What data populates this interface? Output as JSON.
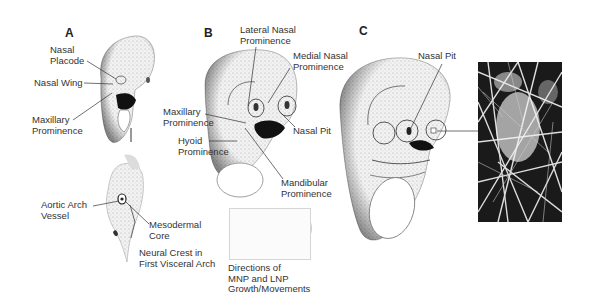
{
  "figure": {
    "panels": [
      {
        "id": "A",
        "label": "A"
      },
      {
        "id": "B",
        "label": "B"
      },
      {
        "id": "C",
        "label": "C"
      }
    ],
    "panel_a": {
      "labels": {
        "nasal_placode": [
          "Nasal",
          "Placode"
        ],
        "nasal_wing": "Nasal Wing",
        "maxillary_prominence": [
          "Maxillary",
          "Prominence"
        ]
      },
      "section_labels": {
        "aortic_arch_vessel": [
          "Aortic Arch",
          "Vessel"
        ],
        "mesodermal_core": [
          "Mesodermal",
          "Core"
        ],
        "neural_crest": [
          "Neural Crest in",
          "First Visceral Arch"
        ]
      }
    },
    "panel_b": {
      "labels": {
        "lateral_nasal_prominence": [
          "Lateral Nasal",
          "Prominence"
        ],
        "medial_nasal_prominence": [
          "Medial Nasal",
          "Prominence"
        ],
        "maxillary_prominence": [
          "Maxillary",
          "Prominence"
        ],
        "nasal_pit": "Nasal Pit",
        "hyoid_prominence": [
          "Hyoid",
          "Prominence"
        ],
        "mandibular_prominence": [
          "Mandibular",
          "Prominence"
        ]
      },
      "inset_caption": [
        "Directions of",
        "MNP and LNP",
        "Growth/Movements"
      ]
    },
    "panel_c": {
      "labels": {
        "nasal_pit": "Nasal Pit"
      },
      "photo": "sem-micrograph"
    }
  }
}
